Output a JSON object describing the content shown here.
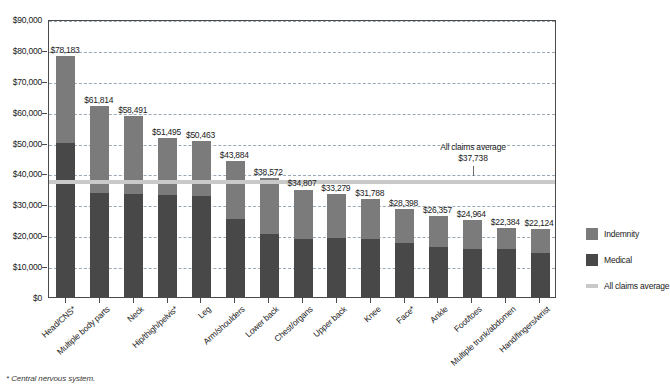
{
  "chart_data": {
    "type": "bar",
    "subtype": "stacked-bar",
    "title": "",
    "xlabel": "",
    "ylabel": "",
    "ylim": [
      0,
      90000
    ],
    "ytick_labels": [
      "$0",
      "$10,000",
      "$20,000",
      "$30,000",
      "$40,000",
      "$50,000",
      "$60,000",
      "$70,000",
      "$80,000",
      "$90,000"
    ],
    "ytick_values": [
      0,
      10000,
      20000,
      30000,
      40000,
      50000,
      60000,
      70000,
      80000,
      90000
    ],
    "grid": true,
    "legend_position": "right",
    "categories": [
      "Head/CNS*",
      "Multiple body parts",
      "Neck",
      "Hip/thigh/pelvis*",
      "Leg",
      "Arm/shoulders",
      "Lower back",
      "Chest/organs",
      "Upper back",
      "Knee",
      "Face*",
      "Ankle",
      "Foot/toes",
      "Multiple trunk/abdomen",
      "Hand/fingers/wrist"
    ],
    "totals": [
      78183,
      61814,
      58491,
      51495,
      50463,
      43884,
      38572,
      34807,
      33279,
      31788,
      28398,
      26357,
      24964,
      22384,
      22124
    ],
    "total_labels": [
      "$78,183",
      "$61,814",
      "$58,491",
      "$51,495",
      "$50,463",
      "$43,884",
      "$38,572",
      "$34,807",
      "$33,279",
      "$31,788",
      "$28,398",
      "$26,357",
      "$24,964",
      "$22,384",
      "$22,124"
    ],
    "series": [
      {
        "name": "Medical",
        "color": "#484848",
        "values": [
          49800,
          33600,
          33300,
          33100,
          32600,
          25400,
          20400,
          18900,
          19000,
          18700,
          17500,
          16200,
          15700,
          15400,
          14400
        ]
      },
      {
        "name": "Indemnity",
        "color": "#7b7b7b",
        "values": [
          28383,
          28214,
          25191,
          18395,
          17863,
          18484,
          18172,
          15907,
          14279,
          13088,
          10898,
          10157,
          9264,
          6984,
          7724
        ]
      }
    ],
    "reference_line": {
      "name": "All claims average",
      "value": 37738,
      "label": "$37,738",
      "color": "#c9c9c9"
    },
    "annotations": [
      {
        "name": "all-claims-average-callout",
        "line1": "All claims average",
        "line2": "$37,738"
      }
    ],
    "legend": [
      {
        "label": "Indemnity",
        "swatch": "indemnity-swatch",
        "color": "#7b7b7b"
      },
      {
        "label": "Medical",
        "swatch": "medical-swatch",
        "color": "#484848"
      },
      {
        "label": "All claims average",
        "swatch": "average-line-swatch",
        "color": "#c9c9c9"
      }
    ],
    "footnote": "* Central nervous system."
  }
}
